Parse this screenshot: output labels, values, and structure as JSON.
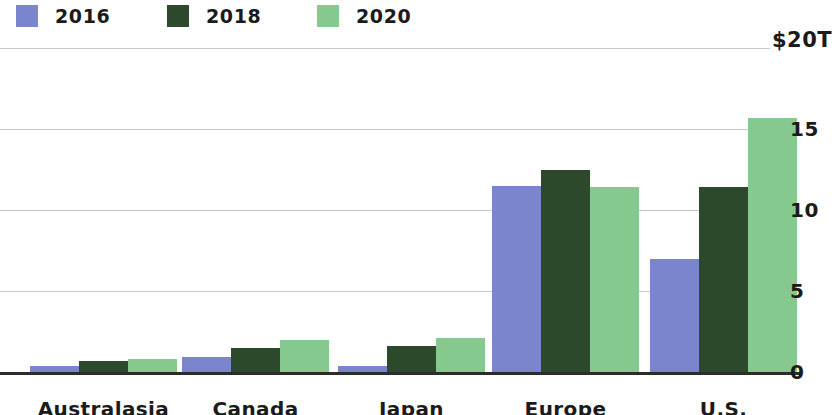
{
  "legend": {
    "items": [
      {
        "label": "2016",
        "color": "#7b85cd"
      },
      {
        "label": "2018",
        "color": "#2c4a2b"
      },
      {
        "label": "2020",
        "color": "#85c98f"
      }
    ]
  },
  "axis": {
    "top_label": "$20T",
    "ticks": [
      {
        "label": "15",
        "value": 15
      },
      {
        "label": "10",
        "value": 10
      },
      {
        "label": "5",
        "value": 5
      },
      {
        "label": "0",
        "value": 0
      }
    ]
  },
  "chart_data": {
    "type": "bar",
    "title": "",
    "subtitle": "",
    "xlabel": "",
    "ylabel": "$20T",
    "ylim": [
      0,
      20
    ],
    "ytick_labels": [
      "0",
      "5",
      "10",
      "15",
      "$20T"
    ],
    "ytick_values": [
      0,
      5,
      10,
      15,
      20
    ],
    "grid": true,
    "legend_position": "top-left",
    "categories": [
      "Australasia",
      "Canada",
      "Japan",
      "Europe",
      "U.S."
    ],
    "series": [
      {
        "name": "2016",
        "color": "#7b85cd",
        "values": [
          0.4,
          0.9,
          0.4,
          11.5,
          7.0
        ]
      },
      {
        "name": "2018",
        "color": "#2c4a2b",
        "values": [
          0.7,
          1.5,
          1.6,
          12.5,
          11.4
        ]
      },
      {
        "name": "2020",
        "color": "#85c98f",
        "values": [
          0.8,
          2.0,
          2.1,
          11.4,
          15.7
        ]
      }
    ]
  }
}
